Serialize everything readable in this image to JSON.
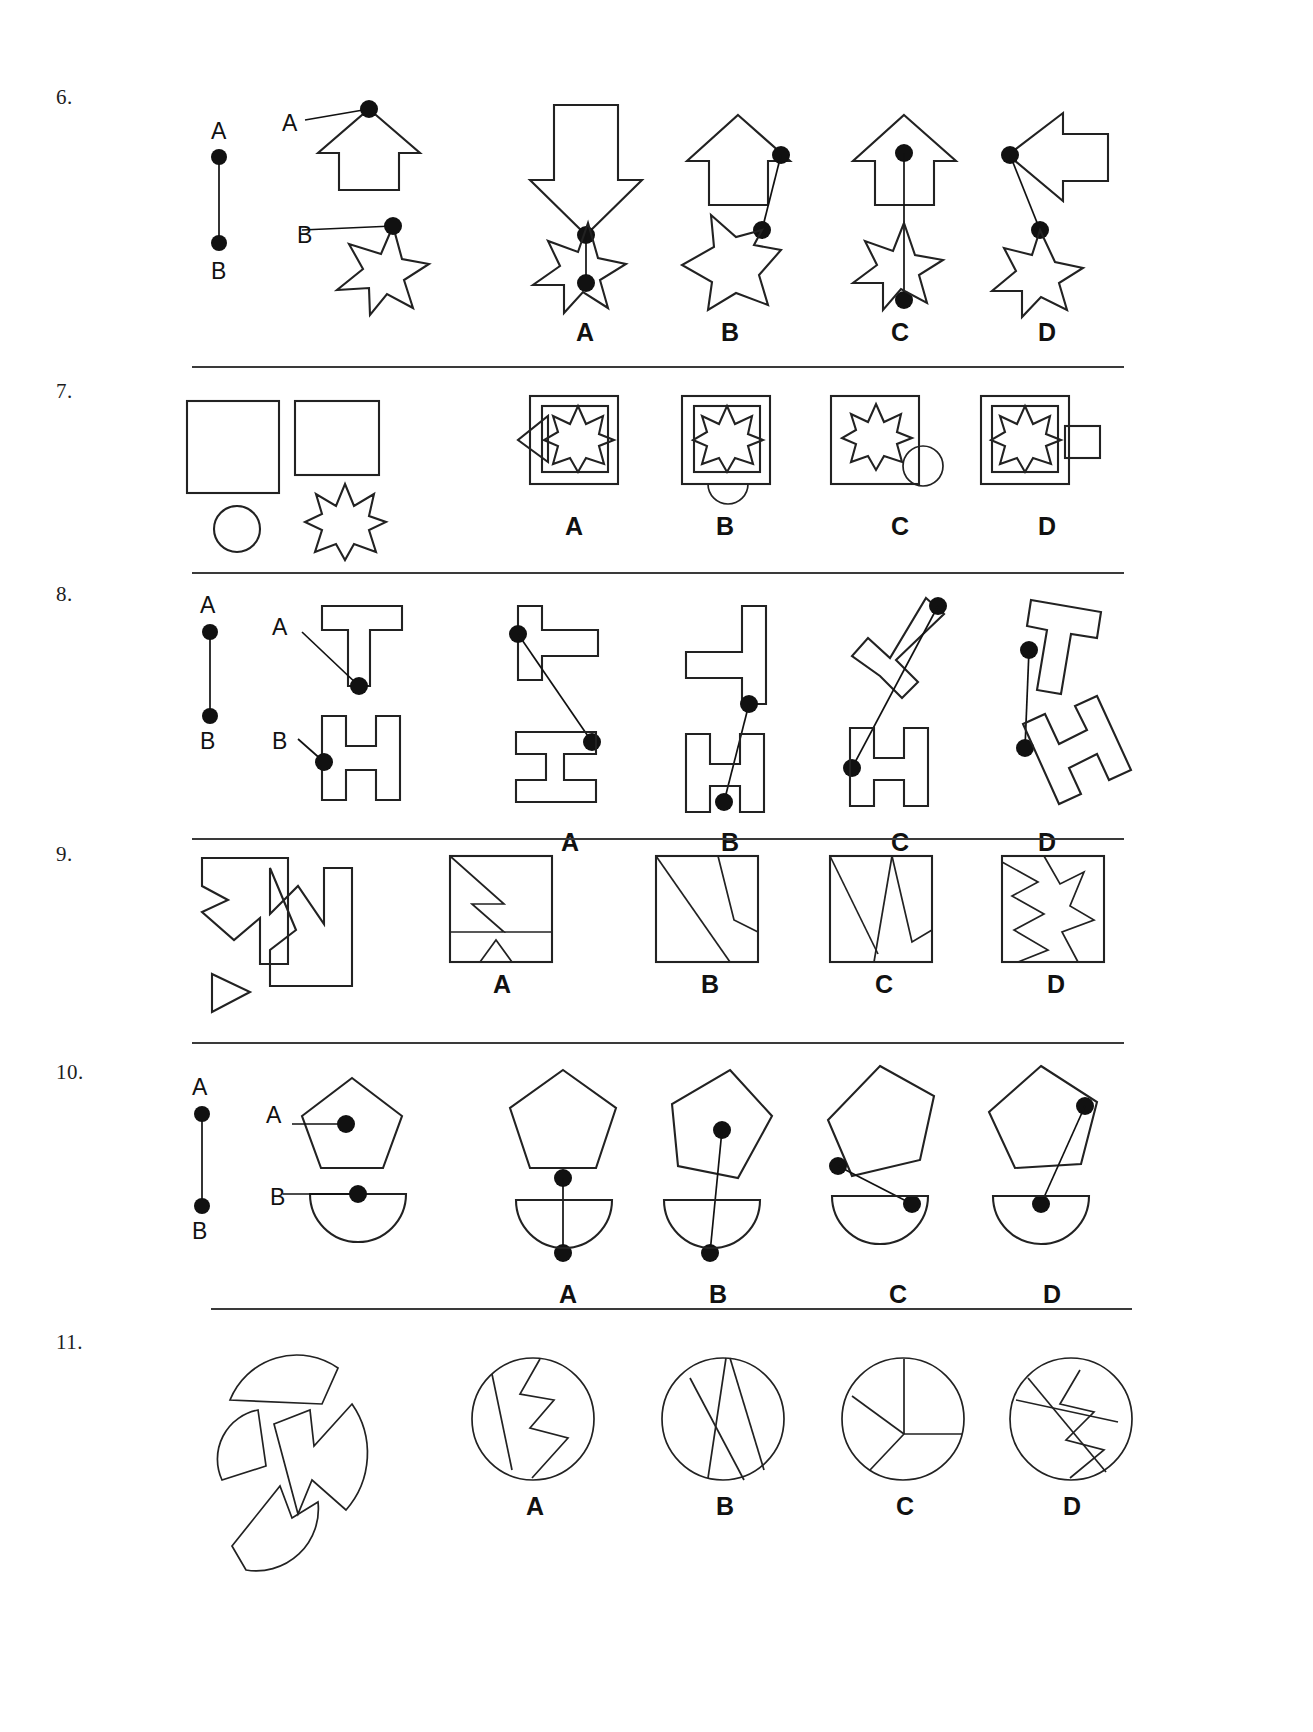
{
  "page": {
    "type": "spatial-reasoning-worksheet",
    "width": 1313,
    "height": 1732,
    "background": "#ffffff",
    "ink_color": "#222222"
  },
  "option_labels": [
    "A",
    "B",
    "C",
    "D"
  ],
  "questions": [
    {
      "number": "6.",
      "kind": "join-the-dots",
      "key_labels": {
        "top": "A",
        "bottom": "B"
      },
      "prompt_labels": {
        "first": "A",
        "second": "B"
      },
      "prompt_shapes": [
        "up-arrow-house",
        "six-point-star"
      ],
      "options": [
        {
          "label": "A",
          "shapes": [
            "down-arrow",
            "six-point-star"
          ]
        },
        {
          "label": "B",
          "shapes": [
            "up-arrow-house",
            "five-point-star"
          ]
        },
        {
          "label": "C",
          "shapes": [
            "up-arrow-house",
            "six-point-star"
          ]
        },
        {
          "label": "D",
          "shapes": [
            "left-arrow",
            "five-point-star"
          ]
        }
      ]
    },
    {
      "number": "7.",
      "kind": "shape-assembly",
      "prompt_shapes": [
        "large-square",
        "small-square",
        "circle",
        "eight-point-star"
      ],
      "options": [
        {
          "label": "A",
          "shapes": [
            "square",
            "inner-square",
            "star",
            "triangle"
          ]
        },
        {
          "label": "B",
          "shapes": [
            "square",
            "inner-square",
            "star",
            "circle"
          ]
        },
        {
          "label": "C",
          "shapes": [
            "square",
            "star",
            "circle"
          ]
        },
        {
          "label": "D",
          "shapes": [
            "square",
            "inner-square",
            "star",
            "rectangle"
          ]
        }
      ]
    },
    {
      "number": "8.",
      "kind": "join-the-dots",
      "key_labels": {
        "top": "A",
        "bottom": "B"
      },
      "prompt_labels": {
        "first": "A",
        "second": "B"
      },
      "prompt_shapes": [
        "letter-T-block",
        "letter-H-block"
      ],
      "options": [
        {
          "label": "A",
          "shapes": [
            "letter-T-block-rotated",
            "letter-I-block"
          ]
        },
        {
          "label": "B",
          "shapes": [
            "letter-T-block-rotated",
            "letter-H-block"
          ]
        },
        {
          "label": "C",
          "shapes": [
            "letter-T-block-tilted",
            "letter-H-block"
          ]
        },
        {
          "label": "D",
          "shapes": [
            "letter-T-block-tilted",
            "letter-H-block-tilted"
          ]
        }
      ]
    },
    {
      "number": "9.",
      "kind": "shape-assembly",
      "prompt_shapes": [
        "zigzag-piece-left",
        "zigzag-piece-right",
        "small-triangle"
      ],
      "options": [
        {
          "label": "A",
          "shapes": [
            "square-with-notch"
          ]
        },
        {
          "label": "B",
          "shapes": [
            "square-with-diagonals"
          ]
        },
        {
          "label": "C",
          "shapes": [
            "square-with-v-cuts"
          ]
        },
        {
          "label": "D",
          "shapes": [
            "square-with-zigzag"
          ]
        }
      ]
    },
    {
      "number": "10.",
      "kind": "join-the-dots",
      "key_labels": {
        "top": "A",
        "bottom": "B"
      },
      "prompt_labels": {
        "first": "A",
        "second": "B"
      },
      "prompt_shapes": [
        "pentagon",
        "semicircle"
      ],
      "options": [
        {
          "label": "A",
          "shapes": [
            "pentagon",
            "semicircle"
          ]
        },
        {
          "label": "B",
          "shapes": [
            "pentagon-tilted",
            "semicircle"
          ]
        },
        {
          "label": "C",
          "shapes": [
            "pentagon-tilted",
            "semicircle"
          ]
        },
        {
          "label": "D",
          "shapes": [
            "pentagon-tilted",
            "semicircle"
          ]
        }
      ]
    },
    {
      "number": "11.",
      "kind": "shape-assembly",
      "prompt_shapes": [
        "circle-segment-top",
        "circle-segment-left",
        "circle-segment-center",
        "circle-segment-bottom"
      ],
      "options": [
        {
          "label": "A",
          "shapes": [
            "circle-with-zigzag-cut"
          ]
        },
        {
          "label": "B",
          "shapes": [
            "circle-with-three-cuts"
          ]
        },
        {
          "label": "C",
          "shapes": [
            "circle-with-wedge-cut"
          ]
        },
        {
          "label": "D",
          "shapes": [
            "circle-with-lightning-cut"
          ]
        }
      ]
    }
  ]
}
